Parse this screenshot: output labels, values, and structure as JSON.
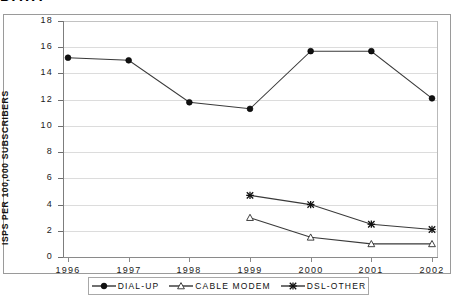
{
  "title_fragment": "DATA",
  "chart_data": {
    "type": "line",
    "title": "",
    "xlabel": "",
    "ylabel": "ISPS PER 100,000 SUBSCRIBERS",
    "categories": [
      "1996",
      "1997",
      "1998",
      "1999",
      "2000",
      "2001",
      "2002"
    ],
    "ytick_labels": [
      "18",
      "16",
      "14",
      "12",
      "10",
      "8",
      "6",
      "4",
      "2",
      "0"
    ],
    "ylim": [
      0,
      18
    ],
    "ytick_step": 2,
    "grid": true,
    "legend_position": "bottom",
    "series": [
      {
        "name": "DIAL-UP",
        "marker": "filled-circle",
        "color": "#000000",
        "x": [
          "1996",
          "1997",
          "1998",
          "1999",
          "2000",
          "2001",
          "2002"
        ],
        "values": [
          15.2,
          15.0,
          11.8,
          11.3,
          15.7,
          15.7,
          12.1
        ]
      },
      {
        "name": "CABLE MODEM",
        "marker": "open-triangle",
        "color": "#000000",
        "x": [
          "1999",
          "2000",
          "2001",
          "2002"
        ],
        "values": [
          3.0,
          1.5,
          1.0,
          1.0
        ]
      },
      {
        "name": "DSL-OTHER",
        "marker": "cross-star",
        "color": "#000000",
        "x": [
          "1999",
          "2000",
          "2001",
          "2002"
        ],
        "values": [
          4.7,
          4.0,
          2.5,
          2.1
        ]
      }
    ]
  },
  "legend": {
    "items": [
      {
        "label": "DIAL-UP",
        "marker": "filled-circle"
      },
      {
        "label": "CABLE MODEM",
        "marker": "open-triangle"
      },
      {
        "label": "DSL-OTHER",
        "marker": "cross-star"
      }
    ]
  },
  "colors": {
    "line": "#3a3a3a",
    "grid": "#dcdcdc",
    "axis": "#8a8a8a",
    "text": "#111111"
  }
}
